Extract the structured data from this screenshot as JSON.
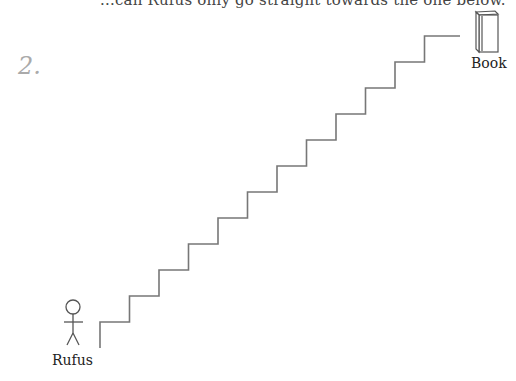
{
  "top_text": "...can Rufus only go straight towards the one below.",
  "problem_number": "2.",
  "figure": {
    "label": "Rufus"
  },
  "goal": {
    "label": "Book"
  },
  "staircase": {
    "steps": 12,
    "start": [
      100,
      348
    ],
    "first_tread_y": 322,
    "step_width": 29.5,
    "step_height": 26,
    "top_landing_end_x": 460,
    "stroke": "#777777"
  }
}
